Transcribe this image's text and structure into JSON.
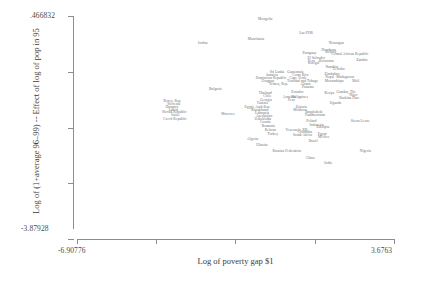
{
  "axes": {
    "y_title": "Log of (1+average 96–99) -- Effect of log of pop in 95",
    "x_title": "Log of poverty gap $1",
    "y_max_label": ".466832",
    "y_min_label": "-3.87928",
    "x_min_label": "-6.90776",
    "x_max_label": "3.6763"
  },
  "chart_data": {
    "type": "scatter",
    "title": "",
    "xlabel": "Log of poverty gap $1",
    "ylabel": "Log of (1+average 96–99) -- Effect of log of pop in 95",
    "xlim": [
      -6.90776,
      3.6763
    ],
    "ylim": [
      -3.87928,
      0.466832
    ],
    "grid": false,
    "legend": "none",
    "x_ticks": [
      -6.90776,
      -4.26,
      -1.62,
      1.03,
      3.6763
    ],
    "y_ticks": [
      0.466832,
      -0.62,
      -1.71,
      -2.79,
      -3.87928
    ],
    "point_label_mode": "country-name-as-marker",
    "points": [
      {
        "label": "Mongolia",
        "x": -0.62,
        "y": 0.4
      },
      {
        "label": "Lao PDR",
        "x": 0.74,
        "y": 0.13
      },
      {
        "label": "Mauritania",
        "x": -0.93,
        "y": 0.02
      },
      {
        "label": "Jordan",
        "x": -2.71,
        "y": -0.05
      },
      {
        "label": "Nicaragua",
        "x": 1.75,
        "y": -0.06
      },
      {
        "label": "Honduras",
        "x": 1.5,
        "y": -0.19
      },
      {
        "label": "Bolivia",
        "x": 1.56,
        "y": -0.24
      },
      {
        "label": "Central African Republic",
        "x": 2.2,
        "y": -0.28
      },
      {
        "label": "Paraguay",
        "x": 0.85,
        "y": -0.26
      },
      {
        "label": "Botswana",
        "x": 1.42,
        "y": -0.41
      },
      {
        "label": "Zambia",
        "x": 2.6,
        "y": -0.39
      },
      {
        "label": "El Salvador",
        "x": 1.08,
        "y": -0.36
      },
      {
        "label": "Peru",
        "x": 0.92,
        "y": -0.41
      },
      {
        "label": "Senegal",
        "x": 0.99,
        "y": -0.44
      },
      {
        "label": "Namibia",
        "x": 1.6,
        "y": -0.53
      },
      {
        "label": "Lesotho",
        "x": 1.84,
        "y": -0.57
      },
      {
        "label": "Zimbabwe",
        "x": 1.62,
        "y": -0.66
      },
      {
        "label": "Sri Lanka",
        "x": -0.23,
        "y": -0.62
      },
      {
        "label": "Guatemala",
        "x": 0.38,
        "y": -0.62
      },
      {
        "label": "Jamaica",
        "x": -0.4,
        "y": -0.68
      },
      {
        "label": "Costa Rica",
        "x": 0.55,
        "y": -0.68
      },
      {
        "label": "Dominican Republic",
        "x": -0.43,
        "y": -0.74
      },
      {
        "label": "Cape Verde",
        "x": 0.47,
        "y": -0.74
      },
      {
        "label": "Nepal",
        "x": 1.53,
        "y": -0.73
      },
      {
        "label": "Madagascar",
        "x": 2.05,
        "y": -0.73
      },
      {
        "label": "Uruguay",
        "x": -0.53,
        "y": -0.79
      },
      {
        "label": "Trinidad and Tobago",
        "x": 0.62,
        "y": -0.79
      },
      {
        "label": "Mozambique",
        "x": 1.69,
        "y": -0.79
      },
      {
        "label": "Mali",
        "x": 2.4,
        "y": -0.8
      },
      {
        "label": "Yemen, Rep.",
        "x": -0.18,
        "y": -0.86
      },
      {
        "label": "Ghana",
        "x": 0.73,
        "y": -0.85
      },
      {
        "label": "Panama",
        "x": 0.8,
        "y": -0.91
      },
      {
        "label": "Bulgaria",
        "x": -2.29,
        "y": -0.95
      },
      {
        "label": "Thailand",
        "x": -0.62,
        "y": -1.04
      },
      {
        "label": "Ecuador",
        "x": 0.45,
        "y": -1.01
      },
      {
        "label": "Kenya",
        "x": 1.52,
        "y": -1.03
      },
      {
        "label": "Gambia, The",
        "x": 2.08,
        "y": -1.02
      },
      {
        "label": "Chile",
        "x": -0.55,
        "y": -1.1
      },
      {
        "label": "Armenia",
        "x": 0.18,
        "y": -1.11
      },
      {
        "label": "Philippines",
        "x": 0.52,
        "y": -1.11
      },
      {
        "label": "Niger",
        "x": 2.32,
        "y": -1.08
      },
      {
        "label": "Georgia",
        "x": -0.6,
        "y": -1.16
      },
      {
        "label": "Peru2",
        "x": 0.25,
        "y": -1.17
      },
      {
        "label": "Burkina Faso",
        "x": 2.18,
        "y": -1.13
      },
      {
        "label": "Korea, Rep.",
        "x": -3.72,
        "y": -1.19
      },
      {
        "label": "Slovenia",
        "x": -3.68,
        "y": -1.24
      },
      {
        "label": "Tunisia",
        "x": -0.72,
        "y": -1.22
      },
      {
        "label": "Uganda",
        "x": 1.72,
        "y": -1.22
      },
      {
        "label": "Hungary",
        "x": -3.74,
        "y": -1.3
      },
      {
        "label": "Egypt, Arab Rep.",
        "x": -0.88,
        "y": -1.3
      },
      {
        "label": "Estonia",
        "x": 0.58,
        "y": -1.3
      },
      {
        "label": "Latvia",
        "x": -3.69,
        "y": -1.36
      },
      {
        "label": "Kazakhstan",
        "x": -0.8,
        "y": -1.36
      },
      {
        "label": "Moldova",
        "x": 0.53,
        "y": -1.36
      },
      {
        "label": "Slovak Republic",
        "x": -3.66,
        "y": -1.41
      },
      {
        "label": "Lithuania",
        "x": -0.73,
        "y": -1.42
      },
      {
        "label": "Morocco",
        "x": -1.87,
        "y": -1.44
      },
      {
        "label": "Bangladesh",
        "x": 1.0,
        "y": -1.41
      },
      {
        "label": "Israel",
        "x": -3.62,
        "y": -1.47
      },
      {
        "label": "Azerbaijan",
        "x": -0.66,
        "y": -1.48
      },
      {
        "label": "Turkmenistan",
        "x": 1.04,
        "y": -1.46
      },
      {
        "label": "Uzbekistan",
        "x": -0.7,
        "y": -1.53
      },
      {
        "label": "Czech Republic",
        "x": -3.64,
        "y": -1.53
      },
      {
        "label": "Croatia",
        "x": -0.62,
        "y": -1.59
      },
      {
        "label": "Poland",
        "x": 0.92,
        "y": -1.58
      },
      {
        "label": "Sierra Leone",
        "x": 2.55,
        "y": -1.57
      },
      {
        "label": "Indonesia",
        "x": 1.1,
        "y": -1.65
      },
      {
        "label": "Romania",
        "x": -0.52,
        "y": -1.67
      },
      {
        "label": "Ethiopia",
        "x": 1.3,
        "y": -1.7
      },
      {
        "label": "Venezuela, RB",
        "x": 0.42,
        "y": -1.76
      },
      {
        "label": "Belarus",
        "x": -0.45,
        "y": -1.76
      },
      {
        "label": "Colombia",
        "x": 0.7,
        "y": -1.79
      },
      {
        "label": "Turkey",
        "x": -0.37,
        "y": -1.83
      },
      {
        "label": "South Africa",
        "x": 0.62,
        "y": -1.85
      },
      {
        "label": "Egypt",
        "x": 1.28,
        "y": -1.84
      },
      {
        "label": "Mexico",
        "x": 1.33,
        "y": -1.89
      },
      {
        "label": "Algeria",
        "x": -1.04,
        "y": -1.92
      },
      {
        "label": "Brazil",
        "x": 0.98,
        "y": -1.97
      },
      {
        "label": "Ukraine",
        "x": -0.72,
        "y": -2.05
      },
      {
        "label": "Russian Federation",
        "x": 0.1,
        "y": -2.17
      },
      {
        "label": "Nigeria",
        "x": 2.72,
        "y": -2.17
      },
      {
        "label": "China",
        "x": 0.88,
        "y": -2.3
      },
      {
        "label": "India",
        "x": 1.48,
        "y": -2.4
      }
    ]
  },
  "labels": {
    "mongolia": "Mongolia",
    "lao_pdr": "Lao PDR",
    "mauritania": "Mauritania",
    "jordan": "Jordan",
    "nicaragua": "Nicaragua",
    "honduras": "Honduras",
    "bolivia": "Bolivia",
    "car": "Central African Republic",
    "paraguay": "Paraguay",
    "botswana": "Botswana",
    "zambia": "Zambia",
    "el_salvador": "El Salvador",
    "peru": "Peru",
    "senegal": "Senegal",
    "namibia": "Namibia",
    "lesotho": "Lesotho",
    "zimbabwe": "Zimbabwe",
    "sri_lanka": "Sri Lanka",
    "guatemala": "Guatemala",
    "jamaica": "Jamaica",
    "costa_rica": "Costa Rica",
    "dominican_republic": "Dominican Republic",
    "cape_verde": "Cape Verde",
    "nepal": "Nepal",
    "madagascar": "Madagascar",
    "uruguay": "Uruguay",
    "trinidad": "Trinidad and Tobago",
    "mozambique": "Mozambique",
    "mali": "Mali",
    "yemen": "Yemen, Rep.",
    "ghana": "Ghana",
    "panama": "Panama",
    "bulgaria": "Bulgaria",
    "thailand": "Thailand",
    "ecuador": "Ecuador",
    "kenya": "Kenya",
    "gambia": "Gambia, The",
    "chile": "Chile",
    "armenia": "Armenia",
    "philippines": "Philippines",
    "niger": "Niger",
    "georgia": "Georgia",
    "peru2": "Peru",
    "burkina_faso": "Burkina Faso",
    "korea": "Korea, Rep.",
    "slovenia": "Slovenia",
    "tunisia": "Tunisia",
    "uganda": "Uganda",
    "hungary": "Hungary",
    "egypt_arab_rep": "Egypt, Arab Rep.",
    "estonia": "Estonia",
    "latvia": "Latvia",
    "kazakhstan": "Kazakhstan",
    "moldova": "Moldova",
    "slovak_republic": "Slovak Republic",
    "lithuania": "Lithuania",
    "morocco": "Morocco",
    "bangladesh": "Bangladesh",
    "israel": "Israel",
    "azerbaijan": "Azerbaijan",
    "turkmenistan": "Turkmenistan",
    "uzbekistan": "Uzbekistan",
    "czech_republic": "Czech Republic",
    "croatia": "Croatia",
    "poland": "Poland",
    "sierra_leone": "Sierra Leone",
    "indonesia": "Indonesia",
    "romania": "Romania",
    "ethiopia": "Ethiopia",
    "venezuela": "Venezuela, RB",
    "belarus": "Belarus",
    "colombia": "Colombia",
    "turkey": "Turkey",
    "south_africa": "South Africa",
    "egypt": "Egypt",
    "mexico": "Mexico",
    "algeria": "Algeria",
    "brazil": "Brazil",
    "ukraine": "Ukraine",
    "russian_federation": "Russian Federation",
    "nigeria": "Nigeria",
    "china": "China",
    "india": "India"
  }
}
